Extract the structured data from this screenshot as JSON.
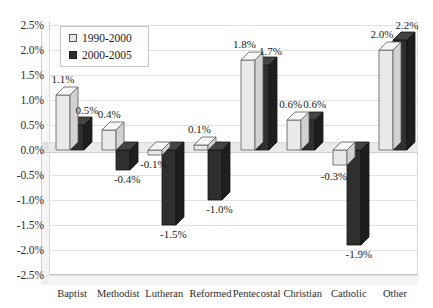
{
  "chart_data": {
    "type": "bar",
    "title": "",
    "subtitle": "",
    "xlabel": "",
    "ylabel": "",
    "ylim": [
      -2.5,
      2.5
    ],
    "ytick_step": 0.5,
    "grid": true,
    "legend_position": "top-left",
    "value_suffix": "%",
    "categories": [
      "Baptist",
      "Methodist",
      "Lutheran",
      "Reformed",
      "Pentecostal",
      "Christian",
      "Catholic",
      "Other"
    ],
    "ytick_labels": [
      "2.5%",
      "2.0%",
      "1.5%",
      "1.0%",
      "0.5%",
      "0.0%",
      "-0.5%",
      "-1.0%",
      "-1.5%",
      "-2.0%",
      "-2.5%"
    ],
    "ytick_values": [
      2.5,
      2.0,
      1.5,
      1.0,
      0.5,
      0.0,
      -0.5,
      -1.0,
      -1.5,
      -2.0,
      -2.5
    ],
    "series": [
      {
        "name": "1990-2000",
        "color": "#e8e8e8",
        "values": [
          1.1,
          0.4,
          -0.1,
          0.1,
          1.8,
          0.6,
          -0.3,
          2.0
        ],
        "labels": [
          "1.1%",
          "0.4%",
          "-0.1%",
          "0.1%",
          "1.8%",
          "0.6%",
          "-0.3%",
          "2.0%"
        ]
      },
      {
        "name": "2000-2005",
        "color": "#2e2e2e",
        "values": [
          0.5,
          -0.4,
          -1.5,
          -1.0,
          1.7,
          0.6,
          -1.9,
          2.2
        ],
        "labels": [
          "0.5%",
          "-0.4%",
          "-1.5%",
          "-1.0%",
          "1.7%",
          "0.6%",
          "-1.9%",
          "2.2%"
        ]
      }
    ]
  },
  "legend": {
    "items": [
      {
        "label": "1990-2000",
        "swatch": "light-square-swatch"
      },
      {
        "label": "2000-2005",
        "swatch": "dark-square-swatch"
      }
    ]
  }
}
